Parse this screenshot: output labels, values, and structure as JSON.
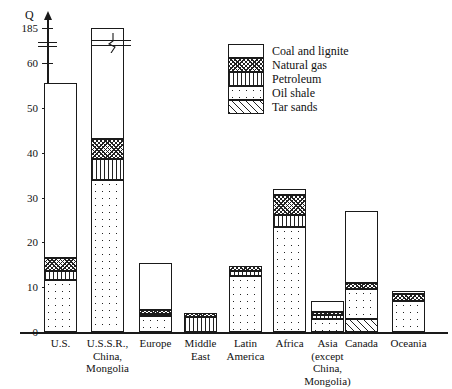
{
  "axis": {
    "y_title": "Q",
    "y_ticks": [
      {
        "label": "0",
        "value": 0
      },
      {
        "label": "10",
        "value": 10
      },
      {
        "label": "20",
        "value": 20
      },
      {
        "label": "30",
        "value": 30
      },
      {
        "label": "40",
        "value": 40
      },
      {
        "label": "50",
        "value": 50
      },
      {
        "label": "60",
        "value": 60
      },
      {
        "label": "185",
        "value": 185
      }
    ],
    "has_break": true,
    "break_between": [
      60,
      185
    ]
  },
  "legend": {
    "position": "top-right-inside",
    "items": [
      {
        "label": "Coal and lignite",
        "pattern": "blank-white"
      },
      {
        "label": "Natural gas",
        "pattern": "cross-hatch"
      },
      {
        "label": "Petroleum",
        "pattern": "vertical-lines"
      },
      {
        "label": "Oil shale",
        "pattern": "dots"
      },
      {
        "label": "Tar sands",
        "pattern": "diagonal-hatch"
      }
    ]
  },
  "chart_data": {
    "type": "bar",
    "stacked": true,
    "title": "",
    "xlabel": "",
    "ylabel": "Q",
    "ylim": [
      0,
      185
    ],
    "axis_break": [
      60,
      185
    ],
    "grid": false,
    "categories": [
      "U.S.",
      "U.S.S.R., China, Mongolia",
      "Europe",
      "Middle East",
      "Latin America",
      "Africa",
      "Asia (except China, Mongolia)",
      "Canada",
      "Oceania"
    ],
    "series": [
      {
        "name": "Tar sands",
        "values": [
          0,
          0,
          0,
          0,
          0,
          0,
          0,
          3.0,
          0
        ]
      },
      {
        "name": "Oil shale",
        "values": [
          11.5,
          34.0,
          3.5,
          0,
          12.5,
          23.5,
          3.0,
          6.5,
          7.0
        ]
      },
      {
        "name": "Petroleum",
        "values": [
          2.0,
          4.5,
          0.5,
          3.3,
          1.2,
          2.5,
          0.7,
          0,
          0
        ]
      },
      {
        "name": "Natural gas",
        "values": [
          3.0,
          4.5,
          1.0,
          1.0,
          1.0,
          4.5,
          0.8,
          1.5,
          1.5
        ]
      },
      {
        "name": "Coal and lignite",
        "values": [
          39.0,
          142.0,
          10.5,
          0,
          0,
          1.5,
          2.5,
          16.0,
          0.7
        ]
      }
    ],
    "totals": [
      55.5,
      185.0,
      15.5,
      4.3,
      14.7,
      32.0,
      7.0,
      27.0,
      9.2
    ]
  },
  "categories_display": [
    [
      "U.S."
    ],
    [
      "U.S.S.R.,",
      "China,",
      "Mongolia"
    ],
    [
      "Europe"
    ],
    [
      "Middle",
      "East"
    ],
    [
      "Latin",
      "America"
    ],
    [
      "Africa"
    ],
    [
      "Asia",
      "(except",
      "China,",
      "Mongolia)"
    ],
    [
      "Canada"
    ],
    [
      "Oceania"
    ]
  ],
  "colors": {
    "ink": "#1a1a1a",
    "background": "#ffffff"
  }
}
